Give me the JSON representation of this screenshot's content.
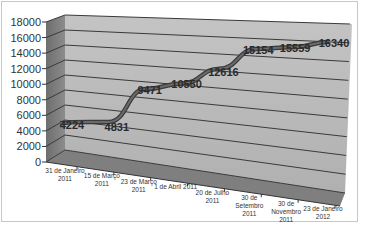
{
  "chart_data": {
    "type": "line",
    "style": "3d-line",
    "title": "",
    "xlabel": "",
    "ylabel": "",
    "ylim": [
      0,
      18000
    ],
    "yticks": [
      0,
      2000,
      4000,
      6000,
      8000,
      10000,
      12000,
      14000,
      16000,
      18000
    ],
    "grid": true,
    "legend": null,
    "categories": [
      "31 de Janeiro 2011",
      "15 de Março 2011",
      "23 de Março 2011",
      "1 de Abril 2011",
      "20 de Julho 2011",
      "30 de Setembro 2011",
      "30 de Novembro 2011",
      "23 de Janeiro 2012"
    ],
    "series": [
      {
        "name": "Series 1",
        "values": [
          4224,
          4831,
          9471,
          10550,
          12616,
          15154,
          15559,
          16340
        ]
      }
    ],
    "data_labels": [
      "4224",
      "4831",
      "9471",
      "10550",
      "12616",
      "15154",
      "15559",
      "16340"
    ],
    "colors": {
      "wall": "#b9b9b9",
      "side_wall": "#7a7a7a",
      "floor": "#808080",
      "line": "#5a5a5a",
      "grid": "#3a3a3a"
    }
  },
  "axis": {
    "y_labels": [
      "18000",
      "16000",
      "14000",
      "12000",
      "10000",
      "8000",
      "6000",
      "4000",
      "2000",
      "0"
    ],
    "x_labels": [
      [
        "31 de Janeiro",
        "2011"
      ],
      [
        "15 de Março",
        "2011"
      ],
      [
        "23 de Março",
        "2011"
      ],
      [
        "1 de Abril 2011"
      ],
      [
        "20 de Julho",
        "2011"
      ],
      [
        "30 de",
        "Setembro",
        "2011"
      ],
      [
        "30 de",
        "Novembro",
        "2011"
      ],
      [
        "23 de Janeiro",
        "2012"
      ]
    ]
  }
}
